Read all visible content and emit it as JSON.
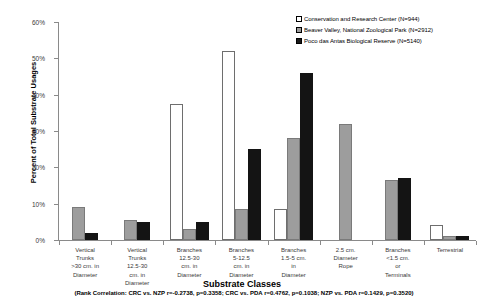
{
  "chart_data": {
    "type": "bar",
    "title": "",
    "xlabel": "Substrate Classes",
    "ylabel": "Percent of Total Substrate Usages",
    "ylim": [
      0,
      60
    ],
    "ytick_labels": [
      "0%",
      "10%",
      "20%",
      "30%",
      "40%",
      "50%",
      "60%"
    ],
    "ytick_values": [
      0,
      10,
      20,
      30,
      40,
      50,
      60
    ],
    "grid": false,
    "legend_position": "top-right",
    "categories": [
      "Vertical Trunks >30 cm. in Diameter",
      "Vertical Trunks 12.5-30 cm. in Diameter",
      "Branches 12.5-30 cm. in Diameter",
      "Branches 5-12.5 cm. in Diameter",
      "Branches 1.5-5 cm. in Diameter",
      "2.5 cm Diameter Rope",
      "Branches <1.5 cm or Terminals",
      "Terrestrial"
    ],
    "category_lines": [
      [
        "Vertical",
        "Trunks",
        ">30 cm. in",
        "Diameter"
      ],
      [
        "Vertical",
        "Trunks",
        "12.5-30",
        "cm. in",
        "Diameter"
      ],
      [
        "Branches",
        "12.5-30",
        "cm. in",
        "Diameter"
      ],
      [
        "Branches",
        "5-12.5",
        "cm. in",
        "Diameter"
      ],
      [
        "Branches",
        "1.5-5 cm.",
        "in",
        "Diameter"
      ],
      [
        "2.5 cm.",
        "Diameter",
        "Rope"
      ],
      [
        "Branches",
        "<1.5 cm.",
        "or",
        "Terminals"
      ],
      [
        "Terrestrial"
      ]
    ],
    "series": [
      {
        "name": "Conservation and Research Center (N=944)",
        "key": "crc",
        "color": "#ffffff",
        "values": [
          0,
          0,
          37.5,
          52.0,
          8.5,
          0,
          0,
          4.0
        ]
      },
      {
        "name": "Beaver Valley, National Zoological Park (N=2912)",
        "key": "nzp",
        "color": "#9d9d9d",
        "values": [
          9.0,
          5.5,
          3.0,
          8.5,
          28.0,
          32.0,
          16.5,
          1.0
        ]
      },
      {
        "name": "Poco das Antas Biological Reserve (N=5140)",
        "key": "pda",
        "color": "#141414",
        "values": [
          2.0,
          5.0,
          5.0,
          25.0,
          46.0,
          0,
          17.0,
          1.0
        ]
      }
    ],
    "annotation": "(Rank Correlation: CRC vs. NZP r=-0.2738, p=0.3358; CRC vs. PDA r=0.4762, p=0.1038; NZP vs. PDA r=0.1429, p=0.3520)"
  }
}
